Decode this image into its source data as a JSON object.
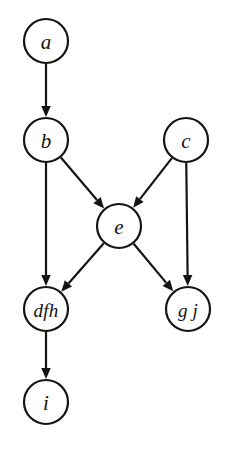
{
  "diagram": {
    "background_color": "#ffffff",
    "stroke_color": "#141414",
    "node_fill": "#ffffff",
    "node_shape": "circle",
    "node_radius": 22,
    "label_style": "italic-serif",
    "canvas": {
      "width": 226,
      "height": 452
    },
    "nodes": [
      {
        "id": "a",
        "label": "a",
        "cx": 46,
        "cy": 41,
        "r": 22
      },
      {
        "id": "b",
        "label": "b",
        "cx": 46,
        "cy": 140,
        "r": 22
      },
      {
        "id": "c",
        "label": "c",
        "cx": 186,
        "cy": 140,
        "r": 22
      },
      {
        "id": "e",
        "label": "e",
        "cx": 119,
        "cy": 226,
        "r": 22
      },
      {
        "id": "dfh",
        "label": "dfh",
        "cx": 46,
        "cy": 309,
        "r": 22
      },
      {
        "id": "gj",
        "label": "g j",
        "cx": 188,
        "cy": 309,
        "r": 22
      },
      {
        "id": "i",
        "label": "i",
        "cx": 46,
        "cy": 402,
        "r": 22
      }
    ],
    "edges": [
      {
        "id": "a-b",
        "from": "a",
        "to": "b",
        "arrow": "solid-triangle"
      },
      {
        "id": "b-e",
        "from": "b",
        "to": "e",
        "arrow": "solid-triangle"
      },
      {
        "id": "b-dfh",
        "from": "b",
        "to": "dfh",
        "arrow": "solid-triangle"
      },
      {
        "id": "c-e",
        "from": "c",
        "to": "e",
        "arrow": "solid-triangle"
      },
      {
        "id": "c-gj",
        "from": "c",
        "to": "gj",
        "arrow": "solid-triangle"
      },
      {
        "id": "e-dfh",
        "from": "e",
        "to": "dfh",
        "arrow": "solid-triangle"
      },
      {
        "id": "e-gj",
        "from": "e",
        "to": "gj",
        "arrow": "solid-triangle"
      },
      {
        "id": "dfh-i",
        "from": "dfh",
        "to": "i",
        "arrow": "solid-triangle"
      }
    ]
  }
}
